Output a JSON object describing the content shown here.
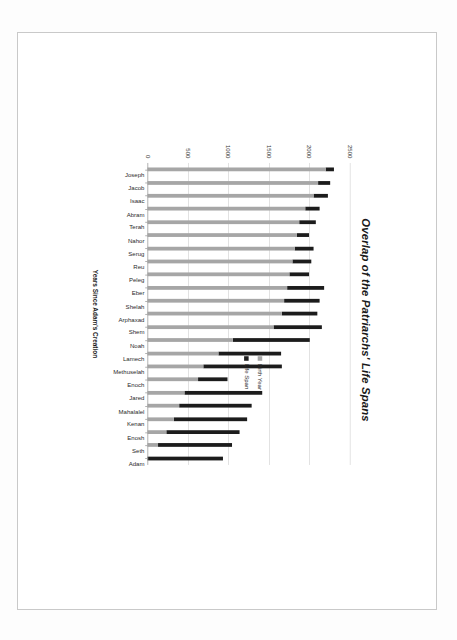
{
  "chart": {
    "title": "Overlap of the Patriarchs' Life Spans",
    "axis_title": "Years Since Adam's Creation",
    "legend": {
      "birth_label": "Birth Year",
      "life_label": "Life Span"
    },
    "colors": {
      "birth_year": "#a6a6a6",
      "life_span": "#1c1c1c",
      "gridline": "#d9d9d9",
      "axis": "#9a9a9a",
      "background": "#ffffff"
    }
  },
  "chart_data": {
    "type": "bar",
    "orientation": "vertical-stacked",
    "title": "Overlap of the Patriarchs' Life Spans",
    "xlabel": "",
    "ylabel": "Years Since Adam's Creation",
    "ylim": [
      0,
      2500
    ],
    "yticks": [
      0,
      500,
      1000,
      1500,
      2000,
      2500
    ],
    "ytick_labels": [
      "0",
      "500",
      "1000",
      "1500",
      "2000",
      "2500"
    ],
    "grid": true,
    "legend_position": "right",
    "categories": [
      "Joseph",
      "Jacob",
      "Isaac",
      "Abram",
      "Terah",
      "Nahor",
      "Serug",
      "Reu",
      "Peleg",
      "Eber",
      "Shelah",
      "Arphaxad",
      "Shem",
      "Noah",
      "Lamech",
      "Methuselah",
      "Enoch",
      "Jared",
      "Mahalalel",
      "Kenan",
      "Enosh",
      "Seth",
      "Adam"
    ],
    "series": [
      {
        "name": "Birth Year",
        "color": "#a6a6a6",
        "values": [
          2199,
          2108,
          2048,
          1948,
          1878,
          1849,
          1819,
          1787,
          1757,
          1723,
          1693,
          1658,
          1558,
          1056,
          874,
          687,
          622,
          460,
          395,
          325,
          235,
          130,
          0
        ]
      },
      {
        "name": "Life Span",
        "color": "#1c1c1c",
        "values": [
          110,
          147,
          180,
          175,
          205,
          148,
          230,
          239,
          239,
          464,
          433,
          438,
          600,
          950,
          777,
          969,
          365,
          962,
          895,
          910,
          905,
          912,
          930
        ]
      }
    ],
    "totals": [
      2309,
      2255,
      2228,
      2123,
      2083,
      1997,
      2049,
      2026,
      1996,
      2187,
      2126,
      2096,
      2158,
      2006,
      1651,
      1656,
      987,
      1422,
      1290,
      1235,
      1140,
      1042,
      930
    ]
  }
}
